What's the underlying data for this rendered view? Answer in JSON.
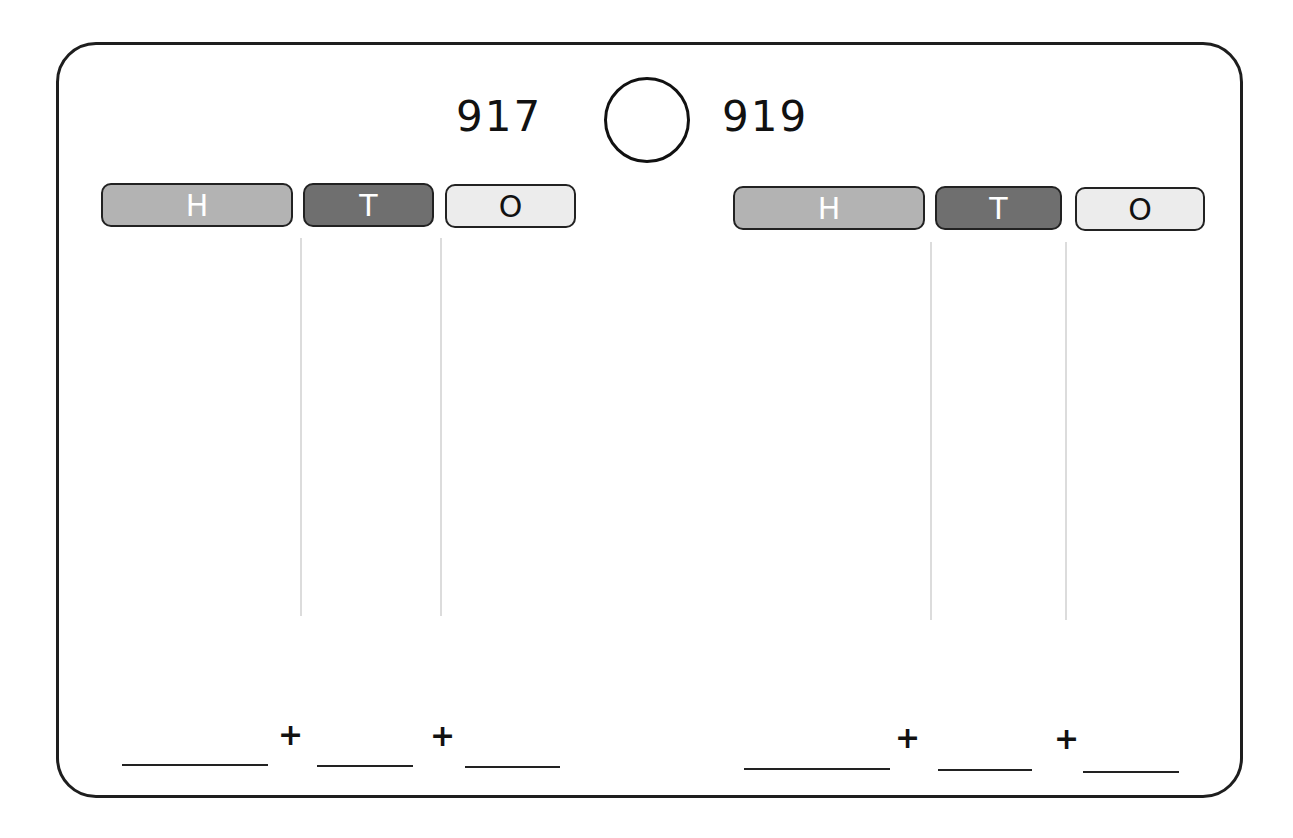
{
  "worksheet": {
    "left_number": "917",
    "right_number": "919",
    "comparison_symbol": "",
    "left_place_values": [
      {
        "label": "H",
        "meaning": "Hundreds",
        "color": "#b3b3b3"
      },
      {
        "label": "T",
        "meaning": "Tens",
        "color": "#6f6f6f"
      },
      {
        "label": "O",
        "meaning": "Ones",
        "color": "#ececec"
      }
    ],
    "right_place_values": [
      {
        "label": "H",
        "meaning": "Hundreds",
        "color": "#b3b3b3"
      },
      {
        "label": "T",
        "meaning": "Tens",
        "color": "#6f6f6f"
      },
      {
        "label": "O",
        "meaning": "Ones",
        "color": "#ececec"
      }
    ],
    "expanded_form_left": {
      "operator_1": "+",
      "operator_2": "+",
      "blanks": [
        "",
        "",
        ""
      ]
    },
    "expanded_form_right": {
      "operator_1": "+",
      "operator_2": "+",
      "blanks": [
        "",
        "",
        ""
      ]
    }
  }
}
